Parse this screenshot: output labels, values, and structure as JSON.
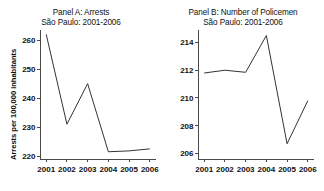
{
  "figure": {
    "background": "#ffffff",
    "line_color": "#333333",
    "axis_color": "#4a4a4a"
  },
  "chart_data": [
    {
      "type": "line",
      "panel": "A",
      "title": "Panel A: Arrests",
      "subtitle": "São Paulo: 2001-2006",
      "xlabel": "",
      "ylabel": "Arrests per 100,000 inhabitants",
      "categories": [
        "2001",
        "2002",
        "2003",
        "2004",
        "2005",
        "2006"
      ],
      "x": [
        2001,
        2002,
        2003,
        2004,
        2005,
        2006
      ],
      "values": [
        262.0,
        231.0,
        245.0,
        221.5,
        221.8,
        222.5
      ],
      "yticks": [
        220,
        230,
        240,
        250,
        260
      ],
      "ytick_labels": [
        "220",
        "230",
        "240",
        "250",
        "260"
      ],
      "xticks": [
        2001,
        2002,
        2003,
        2004,
        2005,
        2006
      ],
      "xtick_labels": [
        "2001",
        "2002",
        "2003",
        "2004",
        "2005",
        "2006"
      ],
      "ylim": [
        219.0,
        263.5
      ],
      "xlim": [
        2000.7,
        2006.3
      ],
      "grid": false,
      "legend": null
    },
    {
      "type": "line",
      "panel": "B",
      "title": "Panel B: Number of Policemen",
      "subtitle": "São Paulo: 2001-2006",
      "xlabel": "",
      "ylabel": "Policemen per 100,000 inhabitants",
      "categories": [
        "2001",
        "2002",
        "2003",
        "2004",
        "2005",
        "2006"
      ],
      "x": [
        2001,
        2002,
        2003,
        2004,
        2005,
        2006
      ],
      "values": [
        211.8,
        212.0,
        211.85,
        214.5,
        206.7,
        209.8
      ],
      "yticks": [
        206,
        208,
        210,
        212,
        214
      ],
      "ytick_labels": [
        "206",
        "208",
        "210",
        "212",
        "214"
      ],
      "xticks": [
        2001,
        2002,
        2003,
        2004,
        2005,
        2006
      ],
      "xtick_labels": [
        "2001",
        "2002",
        "2003",
        "2004",
        "2005",
        "2006"
      ],
      "ylim": [
        205.6,
        214.9
      ],
      "xlim": [
        2000.7,
        2006.3
      ],
      "grid": false,
      "legend": null
    }
  ]
}
